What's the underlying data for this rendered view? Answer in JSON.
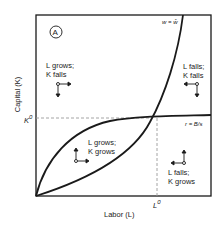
{
  "diagram": {
    "panel_label": "A",
    "y_axis_label": "Capital (K)",
    "x_axis_label": "Labor (L)",
    "k0_label": "K",
    "k0_superscript": "0",
    "l0_label": "L",
    "l0_superscript": "0",
    "curve_w_label": "w = w̄",
    "curve_r_label": "r = B/s",
    "regions": [
      {
        "id": "upper-left",
        "line1": "L grows;",
        "line2": "K falls",
        "arrows": [
          "right",
          "down"
        ]
      },
      {
        "id": "upper-right",
        "line1": "L falls;",
        "line2": "K falls",
        "arrows": [
          "left",
          "down"
        ]
      },
      {
        "id": "middle",
        "line1": "L grows;",
        "line2": "K grows",
        "arrows": [
          "right",
          "up"
        ]
      },
      {
        "id": "lower-right",
        "line1": "L falls;",
        "line2": "K grows",
        "arrows": [
          "left",
          "up"
        ]
      }
    ],
    "colors": {
      "line": "#1a1a1a",
      "dashed": "#9a9a9a",
      "background": "#ffffff"
    }
  }
}
